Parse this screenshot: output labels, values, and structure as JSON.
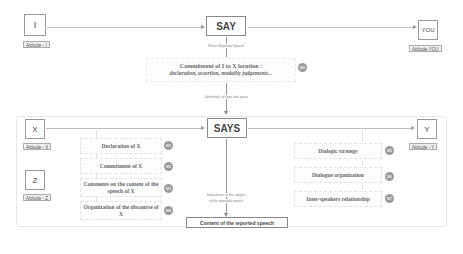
{
  "top": {
    "speaker": {
      "label": "I",
      "attitude": "Attitude - I"
    },
    "verb": "SAY",
    "listener": {
      "label": "YOU",
      "attitude": "Attitude-YOU"
    },
    "direct_caption": "Direct Reported Speech",
    "commitment": {
      "line1": "Commitment of I to X locution  :",
      "line2": "declaration, assertion, modality judgements...",
      "badge": "M0"
    },
    "adverbials_caption": "Adverbials of time and space"
  },
  "bottom": {
    "speaker_x": {
      "label": "X",
      "attitude": "Attitude - X"
    },
    "speaker_z": {
      "label": "Z",
      "attitude": "Attitude - Z"
    },
    "verb": "SAYS",
    "listener_y": {
      "label": "Y",
      "attitude": "Attitude - Y"
    },
    "left_items": [
      {
        "text": "Declaration of X",
        "badge": "M1"
      },
      {
        "text": "Commitment of X",
        "badge": "M2"
      },
      {
        "text": "Comments on the content of the speech of X",
        "badge": "M3"
      },
      {
        "text": "Organization of the discourse of X",
        "badge": "M4"
      }
    ],
    "right_items": [
      {
        "text": "Dialogic strategy",
        "badge": "M5"
      },
      {
        "text": "Dialogue organization",
        "badge": "M6"
      },
      {
        "text": "Inter-speakers relationship",
        "badge": "M7"
      }
    ],
    "indications_caption_1": "Indications of the subject",
    "indications_caption_2": "of the reported speech",
    "content_box": "Content of the reported speech"
  }
}
